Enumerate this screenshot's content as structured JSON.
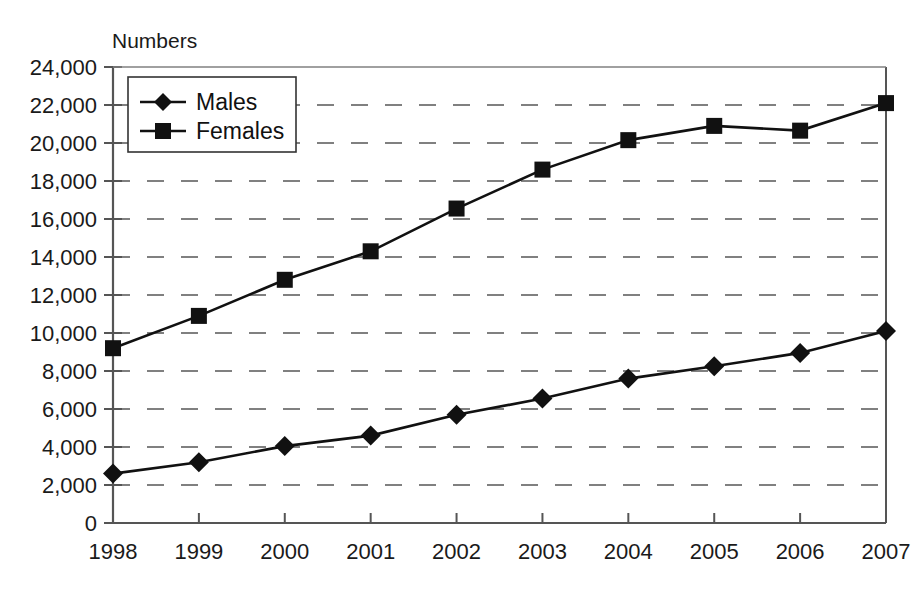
{
  "chart_data": {
    "type": "line",
    "title": "",
    "ylabel": "Numbers",
    "xlabel": "",
    "categories": [
      "1998",
      "1999",
      "2000",
      "2001",
      "2002",
      "2003",
      "2004",
      "2005",
      "2006",
      "2007"
    ],
    "series": [
      {
        "name": "Males",
        "marker": "diamond",
        "values": [
          2600,
          3200,
          4050,
          4600,
          5700,
          6550,
          7600,
          8250,
          8950,
          10100
        ]
      },
      {
        "name": "Females",
        "marker": "square",
        "values": [
          9200,
          10900,
          12800,
          14300,
          16550,
          18600,
          20150,
          20900,
          20650,
          22100
        ]
      }
    ],
    "ylim": [
      0,
      24000
    ],
    "ytick_step": 2000,
    "ytick_labels": [
      "0",
      "2,000",
      "4,000",
      "6,000",
      "8,000",
      "10,000",
      "12,000",
      "14,000",
      "16,000",
      "18,000",
      "20,000",
      "22,000",
      "24,000"
    ],
    "grid": "horizontal-dashed",
    "legend_position": "top-left-inside",
    "line_color": "#111111",
    "grid_color": "#808080",
    "axis_color": "#555555"
  },
  "legend": {
    "entries": [
      {
        "label": "Males"
      },
      {
        "label": "Females"
      }
    ]
  }
}
